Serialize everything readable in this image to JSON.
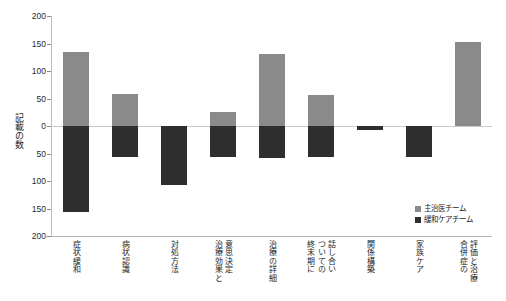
{
  "chart_data": {
    "type": "bar",
    "title": "",
    "xlabel": "",
    "ylabel": "記載の数",
    "ylim": [
      -200,
      200
    ],
    "ytick_values": [
      200,
      150,
      100,
      50,
      0,
      -50,
      -100,
      -150,
      -200
    ],
    "ytick_labels": [
      "200",
      "150",
      "100",
      "50",
      "0",
      "50",
      "100",
      "150",
      "200"
    ],
    "grid": false,
    "legend_position": "lower-right",
    "orientation": "diverging-vertical",
    "categories": [
      "症状緩和",
      "病状認識",
      "対処方法",
      "治療効果と意思決定",
      "治療の詳細",
      "終末期についての話し合い",
      "関係構築",
      "家族ケア",
      "合併症の評価と治療"
    ],
    "category_label_lines": [
      [
        "症状緩和"
      ],
      [
        "病状認識"
      ],
      [
        "対処方法"
      ],
      [
        "治療効果と",
        "意思決定"
      ],
      [
        "治療の詳細"
      ],
      [
        "終末期に",
        "ついての",
        "話し合い"
      ],
      [
        "関係構築"
      ],
      [
        "家族ケア"
      ],
      [
        "合併症の",
        "評価と治療"
      ]
    ],
    "series": [
      {
        "name": "主治医チーム",
        "color": "#8a8a8a",
        "direction": "up",
        "values": [
          134,
          58,
          0,
          25,
          131,
          57,
          0,
          0,
          153
        ]
      },
      {
        "name": "緩和ケアチーム",
        "color": "#2e2e2e",
        "direction": "down",
        "values": [
          -157,
          -57,
          -107,
          -56,
          -58,
          -57,
          -8,
          -57,
          0
        ]
      }
    ]
  },
  "legend": {
    "items": [
      {
        "label": "主治医チーム",
        "color": "#8a8a8a"
      },
      {
        "label": "緩和ケアチーム",
        "color": "#2e2e2e"
      }
    ]
  }
}
